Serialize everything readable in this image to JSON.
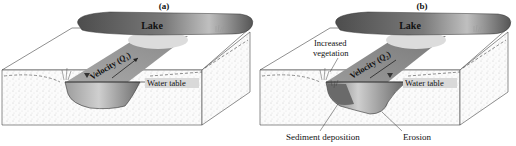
{
  "figure": {
    "panels": [
      {
        "id": "a",
        "label": "(a)",
        "lake_label": "Lake",
        "velocity_label": "Velocity (",
        "velocity_symbol": "Q",
        "velocity_subscript": "1",
        "velocity_close": ")",
        "water_table_label": "Water table"
      },
      {
        "id": "b",
        "label": "(b)",
        "lake_label": "Lake",
        "velocity_label": "Velocity (",
        "velocity_symbol": "Q",
        "velocity_subscript": "2",
        "velocity_close": ")",
        "water_table_label": "Water table",
        "vegetation_label_line1": "Increased",
        "vegetation_label_line2": "vegetation",
        "sediment_label": "Sediment deposition",
        "erosion_label": "Erosion"
      }
    ],
    "colors": {
      "lake_dark": "#5a5a5a",
      "lake_light": "#bdbdbd",
      "channel": "#8a8a8a",
      "soil_dots": "#9a9a9a",
      "outline": "#333333",
      "label_box": "#d9d9d9"
    }
  }
}
